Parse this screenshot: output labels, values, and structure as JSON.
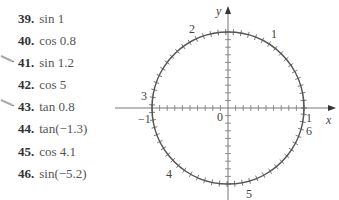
{
  "exercises": [
    {
      "number": "39.",
      "expr": "sin 1",
      "marked": false
    },
    {
      "number": "40.",
      "expr": "cos 0.8",
      "marked": false
    },
    {
      "number": "41.",
      "expr": "sin 1.2",
      "marked": true
    },
    {
      "number": "42.",
      "expr": "cos 5",
      "marked": false
    },
    {
      "number": "43.",
      "expr": "tan 0.8",
      "marked": true
    },
    {
      "number": "44.",
      "expr": "tan(−1.3)",
      "marked": false
    },
    {
      "number": "45.",
      "expr": "cos 4.1",
      "marked": false
    },
    {
      "number": "46.",
      "expr": "sin(−5.2)",
      "marked": false
    }
  ],
  "figure": {
    "x_axis_label": "x",
    "y_axis_label": "y",
    "origin_label": "0",
    "left_label": "−1",
    "right_label": "1",
    "circle_radian_labels": [
      "1",
      "2",
      "3",
      "4",
      "5",
      "6"
    ],
    "tick_step": 0.1,
    "colors": {
      "curve": "#555555",
      "axis": "#777777"
    }
  }
}
